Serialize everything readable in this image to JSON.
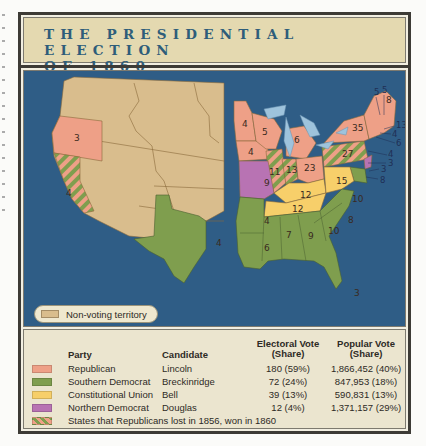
{
  "title": {
    "line1": "THE PRESIDENTIAL ELECTION",
    "line2": "OF 1860"
  },
  "map": {
    "inset_legend": {
      "label": "Non-voting territory",
      "color": "#d9bd8d"
    },
    "colors": {
      "ocean": "#2f5d86",
      "lakes": "#9ec3dc",
      "territory": "#d9bd8d",
      "republican": "#eea087",
      "southern_democrat": "#7f9e4e",
      "constitutional_union": "#f7cf6a",
      "northern_democrat": "#b873b3"
    },
    "state_labels": [
      {
        "state": "Oregon",
        "ev": "3"
      },
      {
        "state": "California",
        "ev": "4"
      },
      {
        "state": "Minnesota",
        "ev": "4"
      },
      {
        "state": "Wisconsin",
        "ev": "5"
      },
      {
        "state": "Michigan",
        "ev": "6"
      },
      {
        "state": "Iowa",
        "ev": "4"
      },
      {
        "state": "Illinois",
        "ev": "11"
      },
      {
        "state": "Indiana",
        "ev": "13"
      },
      {
        "state": "Ohio",
        "ev": "23"
      },
      {
        "state": "Pennsylvania",
        "ev": "27"
      },
      {
        "state": "New York",
        "ev": "35"
      },
      {
        "state": "Vermont",
        "ev": "5"
      },
      {
        "state": "New Hampshire",
        "ev": "5"
      },
      {
        "state": "Maine",
        "ev": "8"
      },
      {
        "state": "Massachusetts",
        "ev": "13"
      },
      {
        "state": "Rhode Island",
        "ev": "4"
      },
      {
        "state": "Connecticut",
        "ev": "6"
      },
      {
        "state": "New Jersey",
        "ev": "4"
      },
      {
        "state": "Delaware",
        "ev": "3"
      },
      {
        "state": "Maryland",
        "ev": "3"
      },
      {
        "state": "Maryland (coast)",
        "ev": "8"
      },
      {
        "state": "Missouri",
        "ev": "9"
      },
      {
        "state": "Kentucky",
        "ev": "12"
      },
      {
        "state": "Virginia",
        "ev": "15"
      },
      {
        "state": "Tennessee",
        "ev": "12"
      },
      {
        "state": "North Carolina",
        "ev": "10"
      },
      {
        "state": "South Carolina",
        "ev": "8"
      },
      {
        "state": "Georgia",
        "ev": "10"
      },
      {
        "state": "Alabama",
        "ev": "9"
      },
      {
        "state": "Mississippi",
        "ev": "7"
      },
      {
        "state": "Louisiana",
        "ev": "6"
      },
      {
        "state": "Arkansas",
        "ev": "4"
      },
      {
        "state": "Texas",
        "ev": "4"
      },
      {
        "state": "Florida",
        "ev": "3"
      }
    ]
  },
  "legend": {
    "headers": {
      "party": "Party",
      "candidate": "Candidate",
      "electoral_vote_1": "Electoral Vote",
      "electoral_vote_2": "(Share)",
      "popular_vote_1": "Popular Vote",
      "popular_vote_2": "(Share)"
    },
    "rows": [
      {
        "party": "Republican",
        "candidate": "Lincoln",
        "electoral": "180 (59%)",
        "popular": "1,866,452 (40%)",
        "color": "#eea087"
      },
      {
        "party": "Southern Democrat",
        "candidate": "Breckinridge",
        "electoral": "72 (24%)",
        "popular": "847,953 (18%)",
        "color": "#7f9e4e"
      },
      {
        "party": "Constitutional Union",
        "candidate": "Bell",
        "electoral": "39 (13%)",
        "popular": "590,831 (13%)",
        "color": "#f7cf6a"
      },
      {
        "party": "Northern Democrat",
        "candidate": "Douglas",
        "electoral": "12 (4%)",
        "popular": "1,371,157 (29%)",
        "color": "#b873b3"
      }
    ],
    "note": "States that Republicans lost in 1856, won in 1860"
  }
}
